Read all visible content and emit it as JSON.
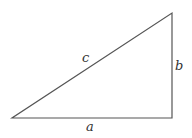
{
  "diagram": {
    "type": "right-triangle",
    "vertices": {
      "bottom_left": [
        12,
        118
      ],
      "bottom_right": [
        172,
        118
      ],
      "top_right": [
        172,
        13
      ]
    },
    "stroke_color": "#555555",
    "labels": {
      "hypotenuse": "c",
      "vertical_leg": "b",
      "horizontal_leg": "a"
    }
  }
}
